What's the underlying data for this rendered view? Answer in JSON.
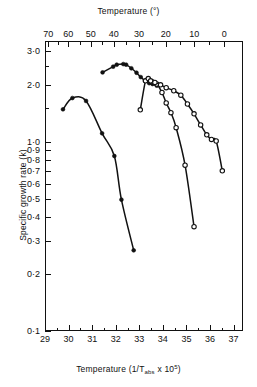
{
  "chart_data": {
    "type": "line",
    "title": "",
    "xlabel": "Temperature (1/Tabs x 10^5)",
    "xlabel_top": "Temperature (°)",
    "ylabel": "Specific growth rate (k)",
    "yscale": "log",
    "ylim": [
      0.1,
      3.4
    ],
    "xlim": [
      29.0,
      37.4
    ],
    "grid": false,
    "legend": "none",
    "xticks_bottom": [
      "29",
      "30",
      "31",
      "32",
      "33",
      "34",
      "35",
      "36",
      "37"
    ],
    "xtick_bottom_values": [
      29,
      30,
      31,
      32,
      33,
      34,
      35,
      36,
      37
    ],
    "xticks_top": [
      "70",
      "60",
      "50",
      "40",
      "30",
      "20",
      "10",
      "0"
    ],
    "xtick_top_values": [
      70,
      60,
      50,
      40,
      30,
      20,
      10,
      0
    ],
    "xtick_top_positions": [
      29.14,
      29.99,
      30.94,
      31.92,
      32.99,
      34.12,
      35.33,
      36.61
    ],
    "yticks": [
      "0·1",
      "0·2",
      "0·3",
      "0·4",
      "0·5",
      "0·6",
      "0·7",
      "0·8",
      "0·9",
      "1·0",
      "2·0",
      "3·0"
    ],
    "ytick_values": [
      0.1,
      0.2,
      0.3,
      0.4,
      0.5,
      0.6,
      0.7,
      0.8,
      0.9,
      1.0,
      2.0,
      3.0
    ],
    "series": [
      {
        "name": "series-1-psychrophile",
        "marker": "filled-circle",
        "points": [
          {
            "x": 29.72,
            "y": 1.5
          },
          {
            "x": 30.12,
            "y": 1.72
          },
          {
            "x": 30.7,
            "y": 1.66
          },
          {
            "x": 31.38,
            "y": 1.12
          },
          {
            "x": 31.9,
            "y": 0.85
          },
          {
            "x": 32.2,
            "y": 0.5
          },
          {
            "x": 32.72,
            "y": 0.27
          }
        ]
      },
      {
        "name": "series-2-mesophile-upper",
        "marker": "filled-circle",
        "points": [
          {
            "x": 31.4,
            "y": 2.35
          },
          {
            "x": 31.85,
            "y": 2.52
          },
          {
            "x": 32.0,
            "y": 2.58
          },
          {
            "x": 32.28,
            "y": 2.6
          },
          {
            "x": 32.4,
            "y": 2.58
          },
          {
            "x": 32.62,
            "y": 2.47
          },
          {
            "x": 32.84,
            "y": 2.34
          },
          {
            "x": 33.02,
            "y": 2.22
          },
          {
            "x": 33.2,
            "y": 2.12
          },
          {
            "x": 33.38,
            "y": 2.06
          },
          {
            "x": 33.52,
            "y": 2.04
          },
          {
            "x": 33.7,
            "y": 2.0
          }
        ]
      },
      {
        "name": "series-3-steep-descent",
        "marker": "open-circle",
        "points": [
          {
            "x": 33.0,
            "y": 1.49
          },
          {
            "x": 33.22,
            "y": 2.12
          },
          {
            "x": 33.34,
            "y": 2.18
          },
          {
            "x": 33.5,
            "y": 2.1
          },
          {
            "x": 33.7,
            "y": 2.04
          },
          {
            "x": 33.92,
            "y": 1.84
          },
          {
            "x": 34.1,
            "y": 1.62
          },
          {
            "x": 34.3,
            "y": 1.44
          },
          {
            "x": 34.52,
            "y": 1.2
          },
          {
            "x": 34.9,
            "y": 0.76
          },
          {
            "x": 35.28,
            "y": 0.36
          }
        ]
      },
      {
        "name": "series-4-thermophile-open",
        "marker": "open-circle",
        "points": [
          {
            "x": 33.44,
            "y": 2.12
          },
          {
            "x": 33.62,
            "y": 2.08
          },
          {
            "x": 33.86,
            "y": 2.02
          },
          {
            "x": 34.1,
            "y": 1.95
          },
          {
            "x": 34.42,
            "y": 1.88
          },
          {
            "x": 34.72,
            "y": 1.78
          },
          {
            "x": 35.0,
            "y": 1.6
          },
          {
            "x": 35.28,
            "y": 1.42
          },
          {
            "x": 35.56,
            "y": 1.24
          },
          {
            "x": 35.82,
            "y": 1.1
          },
          {
            "x": 36.02,
            "y": 1.04
          },
          {
            "x": 36.22,
            "y": 1.02
          },
          {
            "x": 36.48,
            "y": 0.71
          }
        ]
      }
    ]
  },
  "axes": {
    "top_title": "Temperature (°)",
    "bottom_title_prefix": "Temperature (1/T",
    "bottom_title_sub": "abs",
    "bottom_title_mid": " x 10",
    "bottom_title_sup": "5",
    "bottom_title_suffix": ")",
    "y_title": "Specific growth rate (k)"
  }
}
